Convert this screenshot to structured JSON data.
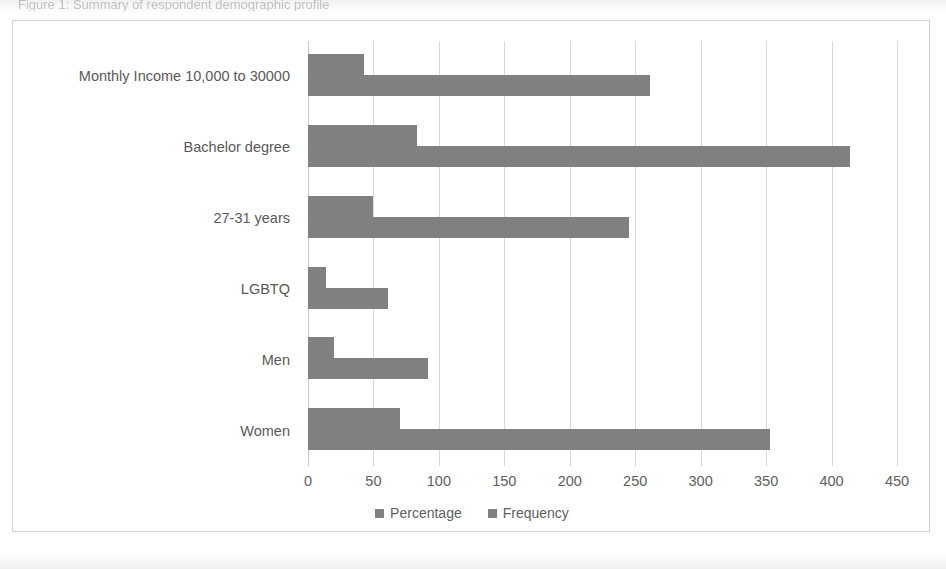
{
  "page": {
    "cut_title": "Figure 1: Summary of respondent demographic profile"
  },
  "chart": {
    "legend": [
      {
        "label": "Percentage",
        "color": "#808080"
      },
      {
        "label": "Frequency",
        "color": "#808080"
      }
    ],
    "bar_color": "#808080",
    "gridline_color": "#d9d9d9"
  },
  "chart_data": {
    "type": "bar",
    "orientation": "horizontal",
    "title": "",
    "xlabel": "",
    "ylabel": "",
    "xlim": [
      0,
      450
    ],
    "xticks": [
      0,
      50,
      100,
      150,
      200,
      250,
      300,
      350,
      400,
      450
    ],
    "grid": true,
    "legend_position": "bottom",
    "categories": [
      "Women",
      "Men",
      "LGBTQ",
      "27-31 years",
      "Bachelor degree",
      "Monthly Income 10,000 to 30000"
    ],
    "series": [
      {
        "name": "Percentage",
        "values": [
          70,
          20,
          14,
          50,
          83,
          43
        ]
      },
      {
        "name": "Frequency",
        "values": [
          353,
          92,
          61,
          245,
          414,
          261
        ]
      }
    ]
  }
}
